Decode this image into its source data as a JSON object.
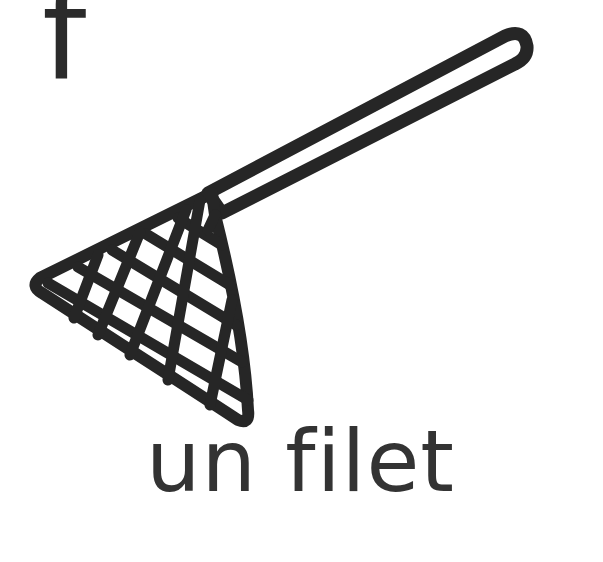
{
  "card": {
    "letter": "f",
    "word": "un filet",
    "illustration": "net-icon"
  },
  "colors": {
    "ink": "#262626",
    "text": "#333333",
    "background": "#ffffff"
  }
}
